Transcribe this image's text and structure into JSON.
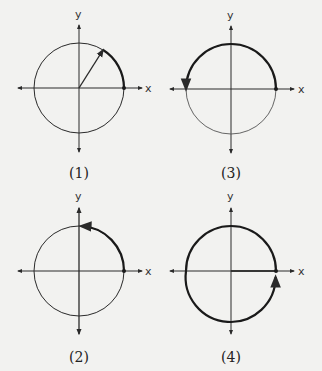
{
  "figure": {
    "background": "#f2f2f0",
    "stroke_color": "#2a2a2a",
    "panels": [
      {
        "id": "1",
        "caption": "(1)",
        "x_label": "x",
        "y_label": "y",
        "center": [
          79,
          88
        ],
        "radius": 45,
        "arc_start_deg": 0,
        "arc_end_deg": 58,
        "direction": "counterclockwise",
        "terminal_ray": true,
        "description": "Angle of about 60° with terminal ray drawn from origin"
      },
      {
        "id": "3",
        "caption": "(3)",
        "x_label": "x",
        "y_label": "y",
        "center": [
          231,
          89
        ],
        "radius": 45,
        "arc_start_deg": 0,
        "arc_end_deg": 180,
        "direction": "counterclockwise",
        "terminal_ray": false,
        "description": "Angle of 180° along negative x-axis"
      },
      {
        "id": "2",
        "caption": "(2)",
        "x_label": "x",
        "y_label": "y",
        "center": [
          79,
          271
        ],
        "radius": 45,
        "arc_start_deg": 0,
        "arc_end_deg": 90,
        "direction": "counterclockwise",
        "terminal_ray": false,
        "description": "Angle of 90° along positive y-axis"
      },
      {
        "id": "4",
        "caption": "(4)",
        "x_label": "x",
        "y_label": "y",
        "center": [
          231,
          271
        ],
        "radius": 45,
        "arc_start_deg": 0,
        "arc_end_deg": 360,
        "direction": "counterclockwise",
        "terminal_ray": false,
        "description": "Full rotation of 360° back to positive x-axis"
      }
    ]
  }
}
